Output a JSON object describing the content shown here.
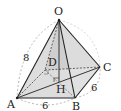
{
  "diagram": {
    "type": "square-pyramid",
    "vertices": {
      "O": {
        "label": "O",
        "x": 59,
        "y": 20
      },
      "A": {
        "label": "A",
        "x": 17,
        "y": 98
      },
      "B": {
        "label": "B",
        "x": 75,
        "y": 98
      },
      "C": {
        "label": "C",
        "x": 100,
        "y": 67
      },
      "D": {
        "label": "D",
        "x": 45,
        "y": 70
      },
      "H": {
        "label": "H",
        "x": 59,
        "y": 82
      }
    },
    "measurements": {
      "OA": "8",
      "AB": "6",
      "BC": "6"
    },
    "colors": {
      "face_fill": "#d9d9d9",
      "face_fill_light": "#e8e8e8",
      "edge": "#222222",
      "hidden_edge": "#555555",
      "arc": "#999999"
    }
  }
}
